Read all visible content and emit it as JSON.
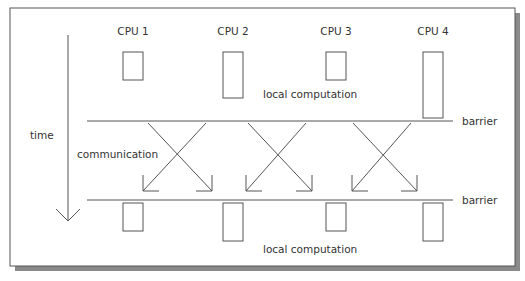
{
  "diagram": {
    "cpus": [
      {
        "label": "CPU 1",
        "x": 133,
        "top_box_h": 28,
        "bottom_box_h": 28
      },
      {
        "label": "CPU 2",
        "x": 233,
        "top_box_h": 46,
        "bottom_box_h": 38
      },
      {
        "label": "CPU 3",
        "x": 336,
        "top_box_h": 28,
        "bottom_box_h": 28
      },
      {
        "label": "CPU 4",
        "x": 433,
        "top_box_h": 66,
        "bottom_box_h": 38
      }
    ],
    "labels": {
      "time": "time",
      "communication": "communication",
      "local_computation_top": "local computation",
      "local_computation_bottom": "local computation",
      "barrier_top": "barrier",
      "barrier_bottom": "barrier"
    },
    "colors": {
      "line": "#555555",
      "text": "#333333",
      "shadow": "#8a8a8a",
      "background": "#ffffff"
    }
  }
}
